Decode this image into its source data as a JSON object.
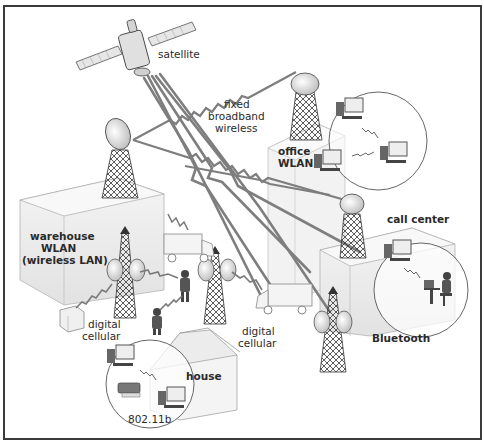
{
  "diagram": {
    "labels": {
      "satellite": "satellite",
      "fixed_broadband_1": "fixed",
      "fixed_broadband_2": "broadband",
      "fixed_broadband_3": "wireless",
      "office_wlan_1": "office",
      "office_wlan_2": "WLAN",
      "call_center": "call center",
      "bluetooth": "Bluetooth",
      "warehouse_1": "warehouse",
      "warehouse_2": "WLAN",
      "warehouse_3": "(wireless LAN)",
      "digital_cellular_left_1": "digital",
      "digital_cellular_left_2": "cellular",
      "digital_cellular_right_1": "digital",
      "digital_cellular_right_2": "cellular",
      "house": "house",
      "wifi_standard": "802.11b"
    },
    "colors": {
      "frame": "#3a3a3a",
      "beam": "#7a7a7a",
      "building_face": "#ececec",
      "building_side": "#f6f6f6",
      "tower": "#333333",
      "text": "#2a2a2a"
    }
  }
}
